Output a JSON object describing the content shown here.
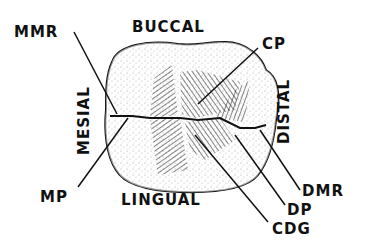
{
  "diagram": {
    "surface_labels": {
      "buccal": "BUCCAL",
      "lingual": "LINGUAL",
      "mesial": "MESIAL",
      "distal": "DISTAL"
    },
    "callouts": [
      {
        "id": "mmr",
        "label": "MMR"
      },
      {
        "id": "cp",
        "label": "CP"
      },
      {
        "id": "mp",
        "label": "MP"
      },
      {
        "id": "dmr",
        "label": "DMR"
      },
      {
        "id": "dp",
        "label": "DP"
      },
      {
        "id": "cdg",
        "label": "CDG"
      }
    ],
    "colors": {
      "ink": "#111111",
      "background": "#ffffff"
    }
  }
}
